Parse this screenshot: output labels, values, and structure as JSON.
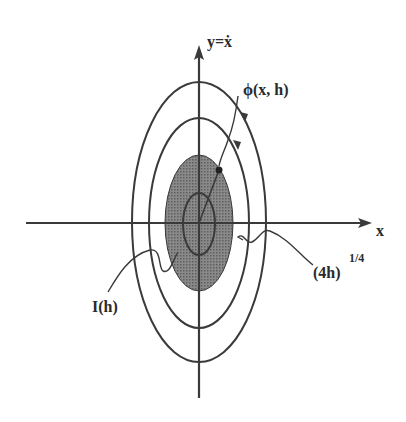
{
  "figure": {
    "axes": {
      "x_label": "x",
      "y_label": "y=ẋ",
      "origin": [
        199,
        223
      ],
      "x_axis_range_px": [
        26,
        372
      ],
      "y_axis_range_px": [
        45,
        398
      ]
    },
    "ellipses": [
      {
        "name": "inner",
        "cx": 199,
        "cy": 224,
        "rx": 16,
        "ry": 31,
        "filled": false
      },
      {
        "name": "shaded-level-set",
        "cx": 199,
        "cy": 223,
        "rx": 34,
        "ry": 68,
        "filled": true
      },
      {
        "name": "middle",
        "cx": 199,
        "cy": 223,
        "rx": 50,
        "ry": 105,
        "filled": false
      },
      {
        "name": "outer",
        "cx": 199,
        "cy": 222,
        "rx": 67,
        "ry": 140,
        "filled": false
      }
    ],
    "labels": {
      "phi": "ϕ(x, h)",
      "amplitude_base": "(4h)",
      "amplitude_exp": "1/4",
      "area": "I(h)"
    },
    "colors": {
      "line": "#3a3a3a",
      "shade": "#7a7a7a",
      "text": "#2a2a2a",
      "background": "#ffffff"
    }
  }
}
